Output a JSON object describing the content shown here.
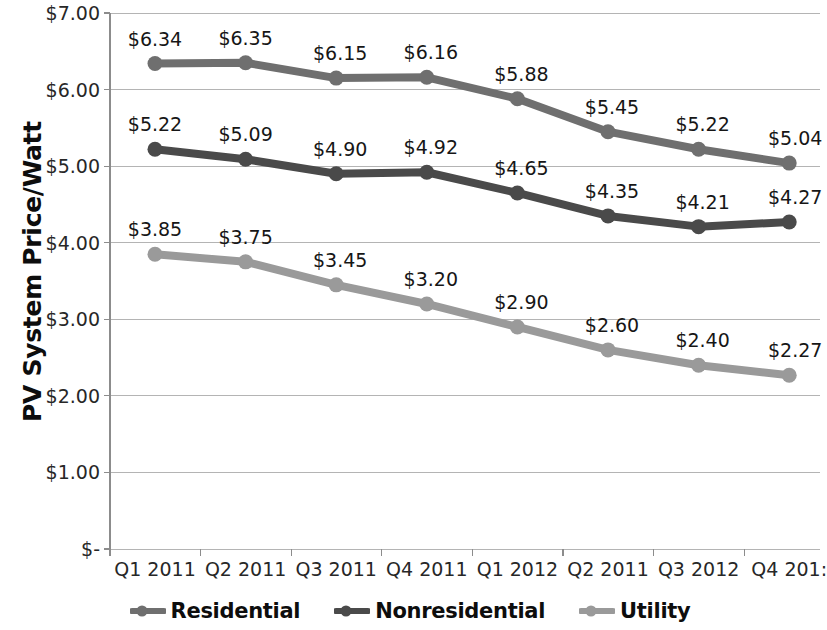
{
  "chart_data": {
    "type": "line",
    "title": "",
    "xlabel": "",
    "ylabel": "PV System Price/Watt",
    "ylim": [
      0,
      7
    ],
    "grid": true,
    "legend_position": "bottom",
    "categories": [
      "Q1 2011",
      "Q2 2011",
      "Q3 2011",
      "Q4 2011",
      "Q1 2012",
      "Q2 2011",
      "Q3 2012",
      "Q4 201:"
    ],
    "y_ticks": [
      7,
      6,
      5,
      4,
      3,
      2,
      1,
      0
    ],
    "y_tick_labels": [
      "$7.00",
      "$6.00",
      "$5.00",
      "$4.00",
      "$3.00",
      "$2.00",
      "$1.00",
      "$-"
    ],
    "series": [
      {
        "name": "Residential",
        "color": "#6f6f6f",
        "values": [
          6.34,
          6.35,
          6.15,
          6.16,
          5.88,
          5.45,
          5.22,
          5.04
        ],
        "labels": [
          "$6.34",
          "$6.35",
          "$6.15",
          "$6.16",
          "$5.88",
          "$5.45",
          "$5.22",
          "$5.04"
        ]
      },
      {
        "name": "Nonresidential",
        "color": "#4a4a4a",
        "values": [
          5.22,
          5.09,
          4.9,
          4.92,
          4.65,
          4.35,
          4.21,
          4.27
        ],
        "labels": [
          "$5.22",
          "$5.09",
          "$4.90",
          "$4.92",
          "$4.65",
          "$4.35",
          "$4.21",
          "$4.27"
        ]
      },
      {
        "name": "Utility",
        "color": "#9a9a9a",
        "values": [
          3.85,
          3.75,
          3.45,
          3.2,
          2.9,
          2.6,
          2.4,
          2.27
        ],
        "labels": [
          "$3.85",
          "$3.75",
          "$3.45",
          "$3.20",
          "$2.90",
          "$2.60",
          "$2.40",
          "$2.27"
        ]
      }
    ]
  },
  "legend": {
    "items": [
      {
        "label": "Residential",
        "color": "#6f6f6f"
      },
      {
        "label": "Nonresidential",
        "color": "#4a4a4a"
      },
      {
        "label": "Utility",
        "color": "#9a9a9a"
      }
    ]
  },
  "axis": {
    "title_y": "PV System Price/Watt",
    "gridline_color": "#b4b4b4",
    "axis_line_color": "#8c8c8c"
  }
}
